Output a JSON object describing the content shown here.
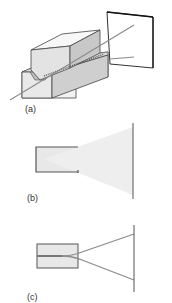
{
  "figure": {
    "panels": [
      {
        "id": "a",
        "label": "(a)",
        "description": "3D waveguide block with laser beam projecting onto screen"
      },
      {
        "id": "b",
        "label": "(b)",
        "description": "Side view: light cone diverging from slit onto screen"
      },
      {
        "id": "c",
        "label": "(c)",
        "description": "Side view: two beams diverging from slit onto screen"
      }
    ]
  },
  "colors": {
    "beam": "#8c8c8c",
    "outline": "#444444",
    "block_fill": "#e6e6e6",
    "cone_fill": "#ececec",
    "screen": "#555555"
  }
}
